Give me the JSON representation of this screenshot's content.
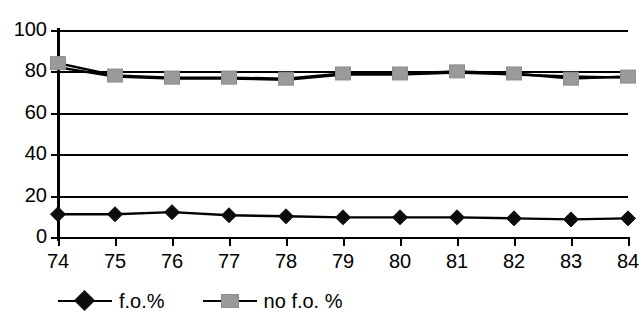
{
  "chart_data": {
    "type": "line",
    "title": "",
    "xlabel": "",
    "ylabel": "",
    "categories": [
      "74",
      "75",
      "76",
      "77",
      "78",
      "79",
      "80",
      "81",
      "82",
      "83",
      "84"
    ],
    "ylim": [
      0,
      100
    ],
    "y_ticks": [
      "0",
      "20",
      "40",
      "60",
      "80",
      "100"
    ],
    "grid": true,
    "legend_position": "bottom-left",
    "series": [
      {
        "name": "f.o.%",
        "marker": "diamond",
        "color": "#0d0d0d",
        "values": [
          11,
          11,
          12,
          10.5,
          10,
          9.5,
          9.5,
          9.5,
          9,
          8.5,
          9
        ]
      },
      {
        "name": "no f.o. %",
        "marker": "square",
        "color": "#9a9a9a",
        "values": [
          84,
          78,
          77,
          77,
          76.5,
          79,
          79,
          80,
          79,
          76.5,
          77.5
        ]
      },
      {
        "name": "",
        "marker": "none",
        "color": "#000000",
        "values": [
          82,
          77.5,
          76.5,
          76.5,
          76,
          78.5,
          78.5,
          79.5,
          78.5,
          77.5,
          77
        ]
      }
    ]
  },
  "axes": {
    "y_axis_name": "value-axis",
    "x_axis_name": "category-axis"
  },
  "legend": {
    "items": [
      {
        "label": "f.o.%",
        "marker": "diamond-marker-icon"
      },
      {
        "label": "no f.o. %",
        "marker": "square-marker-icon"
      }
    ]
  },
  "colors": {
    "axis": "#000000",
    "grid": "#000000",
    "series_primary": "#0d0d0d",
    "series_secondary": "#9a9a9a",
    "background": "#ffffff"
  }
}
